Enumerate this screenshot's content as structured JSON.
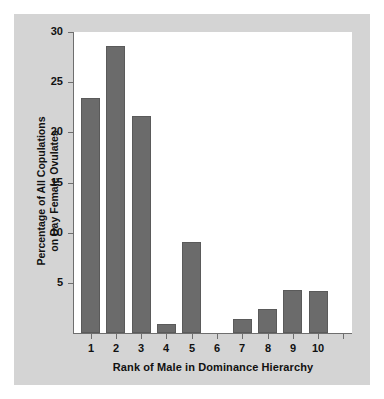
{
  "chart_data": {
    "type": "bar",
    "title": "",
    "xlabel": "Rank of Male in Dominance Hierarchy",
    "ylabel": "Percentage of All Copulations\non Day Female Ovulates",
    "ylabel_line1": "Percentage of All Copulations",
    "ylabel_line2": "on Day Female Ovulates",
    "categories": [
      "1",
      "2",
      "3",
      "4",
      "5",
      "6",
      "7",
      "8",
      "9",
      "10"
    ],
    "values": [
      23.4,
      28.6,
      21.6,
      0.9,
      9.1,
      0,
      1.4,
      2.4,
      4.3,
      4.2
    ],
    "ylim": [
      0,
      30
    ],
    "yticks": [
      5,
      10,
      15,
      20,
      25,
      30
    ],
    "ytick_labels": [
      "5",
      "10",
      "15",
      "20",
      "25",
      "30"
    ],
    "grid": false,
    "legend": null,
    "bar_color": "#6b6b6b",
    "plot_background": "#ffffff",
    "panel_background": "#d4d4d4",
    "axis_color": "#6e6e6e",
    "text_color": "#111111"
  }
}
